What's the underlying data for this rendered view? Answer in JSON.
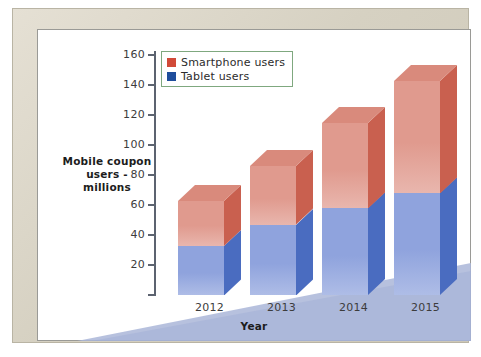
{
  "chart_data": {
    "type": "bar",
    "subtype": "stacked-3d-column",
    "title": "",
    "xlabel": "Year",
    "ylabel": "Mobile coupon users - millions",
    "categories": [
      "2012",
      "2013",
      "2014",
      "2015"
    ],
    "ylim": [
      0,
      160
    ],
    "yticks": [
      0,
      20,
      40,
      60,
      80,
      100,
      120,
      140,
      160
    ],
    "ytick_labels": [
      "",
      "20",
      "40",
      "60",
      "80",
      "100",
      "120",
      "140",
      "160"
    ],
    "grid": false,
    "legend_position": "top-left-inside",
    "series": [
      {
        "name": "Tablet users",
        "color": "#1f4e9c",
        "face_color": "#8fa3dd",
        "values": [
          33,
          47,
          58,
          68
        ]
      },
      {
        "name": "Smartphone users",
        "color": "#d14a38",
        "face_color": "#e09a8e",
        "values": [
          30,
          39,
          57,
          75
        ]
      }
    ],
    "totals": [
      63,
      86,
      115,
      143
    ]
  },
  "axis": {
    "y_title_line1": "Mobile coupon",
    "y_title_line2": "users - millions",
    "x_title": "Year"
  },
  "legend": {
    "items": [
      {
        "label": "Smartphone users",
        "swatch": "#d14a38"
      },
      {
        "label": "Tablet users",
        "swatch": "#1f4e9c"
      }
    ]
  },
  "colors": {
    "frame": "#d9d4c5",
    "paper": "#ffffff",
    "floor": "#aab6d8",
    "axis": "#5c6370",
    "red_front": "#e09a8e",
    "red_top": "#d98a7c",
    "red_side": "#c9604f",
    "blue_front": "#8fa3dd",
    "blue_top": "#7f95d6",
    "blue_side": "#4a6cc0"
  }
}
